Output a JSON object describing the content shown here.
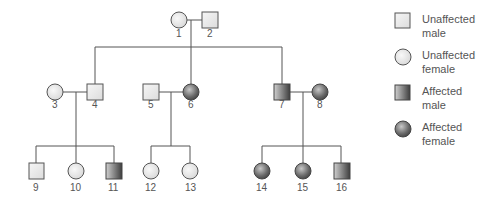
{
  "figure": {
    "type": "pedigree",
    "colors": {
      "line": "#555555",
      "unaffected_fill": "#eeeeee",
      "affected_light": "#cfcfcf",
      "affected_dark": "#444444"
    }
  },
  "individuals": [
    {
      "id": "1",
      "sex": "female",
      "affected": false,
      "generation": 1
    },
    {
      "id": "2",
      "sex": "male",
      "affected": false,
      "generation": 1
    },
    {
      "id": "3",
      "sex": "female",
      "affected": false,
      "generation": 2
    },
    {
      "id": "4",
      "sex": "male",
      "affected": false,
      "generation": 2
    },
    {
      "id": "5",
      "sex": "male",
      "affected": false,
      "generation": 2
    },
    {
      "id": "6",
      "sex": "female",
      "affected": true,
      "generation": 2
    },
    {
      "id": "7",
      "sex": "male",
      "affected": true,
      "generation": 2
    },
    {
      "id": "8",
      "sex": "female",
      "affected": true,
      "generation": 2
    },
    {
      "id": "9",
      "sex": "male",
      "affected": false,
      "generation": 3
    },
    {
      "id": "10",
      "sex": "female",
      "affected": false,
      "generation": 3
    },
    {
      "id": "11",
      "sex": "male",
      "affected": true,
      "generation": 3
    },
    {
      "id": "12",
      "sex": "female",
      "affected": false,
      "generation": 3
    },
    {
      "id": "13",
      "sex": "female",
      "affected": false,
      "generation": 3
    },
    {
      "id": "14",
      "sex": "female",
      "affected": true,
      "generation": 3
    },
    {
      "id": "15",
      "sex": "female",
      "affected": true,
      "generation": 3
    },
    {
      "id": "16",
      "sex": "male",
      "affected": true,
      "generation": 3
    }
  ],
  "labels": {
    "i1": "1",
    "i2": "2",
    "i3": "3",
    "i4": "4",
    "i5": "5",
    "i6": "6",
    "i7": "7",
    "i8": "8",
    "i9": "9",
    "i10": "10",
    "i11": "11",
    "i12": "12",
    "i13": "13",
    "i14": "14",
    "i15": "15",
    "i16": "16"
  },
  "legend": {
    "items": [
      {
        "symbol": "unaffected-male-square",
        "line1": "Unaffected",
        "line2": "male"
      },
      {
        "symbol": "unaffected-female-circle",
        "line1": "Unaffected",
        "line2": "female"
      },
      {
        "symbol": "affected-male-square",
        "line1": "Affected",
        "line2": "male"
      },
      {
        "symbol": "affected-female-circle",
        "line1": "Affected",
        "line2": "female"
      }
    ]
  }
}
